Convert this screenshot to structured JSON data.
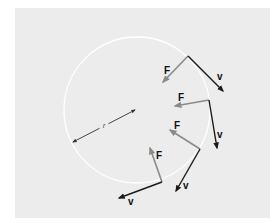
{
  "diagram": {
    "colors": {
      "background": "#ffffff",
      "panel": "#ececec",
      "circle": "#ffffff",
      "force": "#8a8a8a",
      "velocity": "#1a1a1a",
      "radius": "#333333"
    },
    "circle": {
      "cx": 137,
      "cy": 110,
      "r": 73
    },
    "radius_arrow": {
      "x1": 73,
      "y1": 142,
      "x2": 135,
      "y2": 110,
      "label": "r",
      "label_x": 104,
      "label_y": 128
    },
    "vectors": [
      {
        "origin": [
          188,
          56
        ],
        "force_tip": [
          163,
          82
        ],
        "velocity_tip": [
          223,
          91
        ],
        "force_label": "F",
        "force_label_pos": [
          164,
          74
        ],
        "velocity_label": "v",
        "velocity_label_pos": [
          217,
          80
        ]
      },
      {
        "origin": [
          209,
          100
        ],
        "force_tip": [
          175,
          106
        ],
        "velocity_tip": [
          217,
          148
        ],
        "force_label": "F",
        "force_label_pos": [
          178,
          101
        ],
        "velocity_label": "v",
        "velocity_label_pos": [
          217,
          138
        ]
      },
      {
        "origin": [
          200,
          149
        ],
        "force_tip": [
          170,
          130
        ],
        "velocity_tip": [
          176,
          191
        ],
        "force_label": "F",
        "force_label_pos": [
          174,
          129
        ],
        "velocity_label": "v",
        "velocity_label_pos": [
          183,
          189
        ]
      },
      {
        "origin": [
          162,
          182
        ],
        "force_tip": [
          150,
          148
        ],
        "velocity_tip": [
          119,
          198
        ],
        "force_label": "F",
        "force_label_pos": [
          156,
          159
        ],
        "velocity_label": "v",
        "velocity_label_pos": [
          128,
          205
        ]
      }
    ]
  }
}
